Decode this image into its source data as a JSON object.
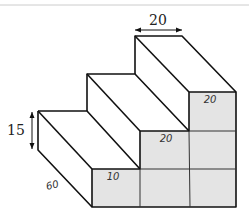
{
  "diagram": {
    "type": "isometric staircase",
    "dimensions": {
      "step_width": "20",
      "step_height": "15",
      "depth": "60"
    },
    "front_face_labels": {
      "bottom_step": "10",
      "middle_step": "20",
      "top_step": "20"
    },
    "colors": {
      "line": "#111111",
      "front_face_fill": "#e4e4e4",
      "top_rule": "#cccccc"
    }
  }
}
